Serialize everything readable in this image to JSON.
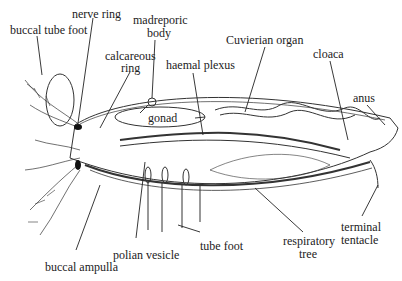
{
  "labels": {
    "buccal_tube_foot": "buccal tube foot",
    "nerve_ring": "nerve ring",
    "madreporic_body_1": "madreporic",
    "madreporic_body_2": "body",
    "calcareous_ring_1": "calcareous",
    "calcareous_ring_2": "ring",
    "haemal_plexus": "haemal plexus",
    "cuvierian_organ": "Cuvierian organ",
    "cloaca": "cloaca",
    "anus": "anus",
    "gonad": "gonad",
    "buccal_ampulla": "buccal ampulla",
    "polian_vesicle": "polian vesicle",
    "tube_foot": "tube foot",
    "respiratory_tree_1": "respiratory",
    "respiratory_tree_2": "tree",
    "terminal_tentacle_1": "terminal",
    "terminal_tentacle_2": "tentacle"
  },
  "colors": {
    "ink": "#222222",
    "background": "#ffffff"
  }
}
